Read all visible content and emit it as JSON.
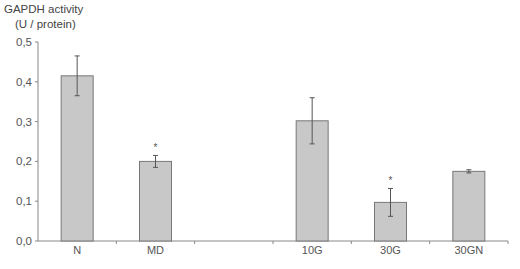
{
  "chart_data": {
    "type": "bar",
    "title": "",
    "ylabel_line1": "GAPDH activity",
    "ylabel_line2": "(U / protein)",
    "xlabel": "",
    "categories": [
      "N",
      "MD",
      "",
      "10G",
      "30G",
      "30GN"
    ],
    "values": [
      0.415,
      0.2,
      null,
      0.302,
      0.097,
      0.175
    ],
    "errors": [
      0.05,
      0.015,
      null,
      0.058,
      0.035,
      0.004
    ],
    "significance": [
      "",
      "*",
      "",
      "",
      "*",
      ""
    ],
    "ylim": [
      0,
      0.5
    ],
    "yticks": [
      "0,0",
      "0,1",
      "0,2",
      "0,3",
      "0,4",
      "0,5"
    ],
    "grid": false,
    "legend": null,
    "bar_color": "#c8c8c8",
    "bar_edge_color": "#777777"
  }
}
